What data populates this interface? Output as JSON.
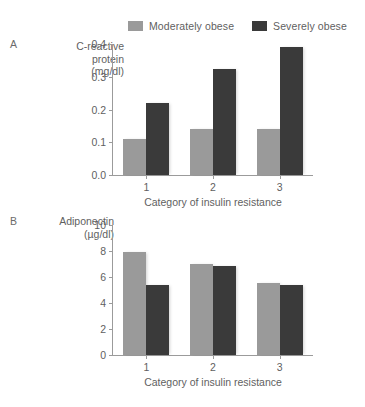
{
  "legend": {
    "items": [
      {
        "label": "Moderately obese",
        "color": "#9a9a9a",
        "key": "moderate"
      },
      {
        "label": "Severely obese",
        "color": "#3a3a3a",
        "key": "severe"
      }
    ]
  },
  "panels": [
    {
      "letter": "A",
      "axis_title_line1": "C-reactive",
      "axis_title_line2": "protein",
      "axis_title_line3": "(mg/dl)"
    },
    {
      "letter": "B",
      "axis_title_line1": "Adiponectin",
      "axis_title_line2": "(µg/dl)",
      "axis_title_line3": ""
    }
  ],
  "chart_data": [
    {
      "type": "bar",
      "panel": "A",
      "title": "",
      "categories": [
        "1",
        "2",
        "3"
      ],
      "series": [
        {
          "name": "Moderately obese",
          "color": "#9a9a9a",
          "values": [
            0.11,
            0.14,
            0.14
          ]
        },
        {
          "name": "Severely obese",
          "color": "#3a3a3a",
          "values": [
            0.22,
            0.325,
            0.39
          ]
        }
      ],
      "xlabel": "Category of insulin resistance",
      "ylabel": "C-reactive protein (mg/dl)",
      "ylim": [
        0.0,
        0.4
      ],
      "yticks": [
        0.0,
        0.1,
        0.2,
        0.3,
        0.4
      ],
      "ytick_labels": [
        "0.0",
        "0.1",
        "0.2",
        "0.3",
        "0.4"
      ],
      "grid": false,
      "legend_position": "top"
    },
    {
      "type": "bar",
      "panel": "B",
      "title": "",
      "categories": [
        "1",
        "2",
        "3"
      ],
      "series": [
        {
          "name": "Moderately obese",
          "color": "#9a9a9a",
          "values": [
            7.95,
            7.0,
            5.55
          ]
        },
        {
          "name": "Severely obese",
          "color": "#3a3a3a",
          "values": [
            5.4,
            6.85,
            5.4
          ]
        }
      ],
      "xlabel": "Category of insulin resistance",
      "ylabel": "Adiponectin (µg/dl)",
      "ylim": [
        0,
        10
      ],
      "yticks": [
        0,
        2,
        4,
        6,
        8,
        10
      ],
      "ytick_labels": [
        "0",
        "2",
        "4",
        "6",
        "8",
        "10"
      ],
      "grid": false,
      "legend_position": "top"
    }
  ]
}
